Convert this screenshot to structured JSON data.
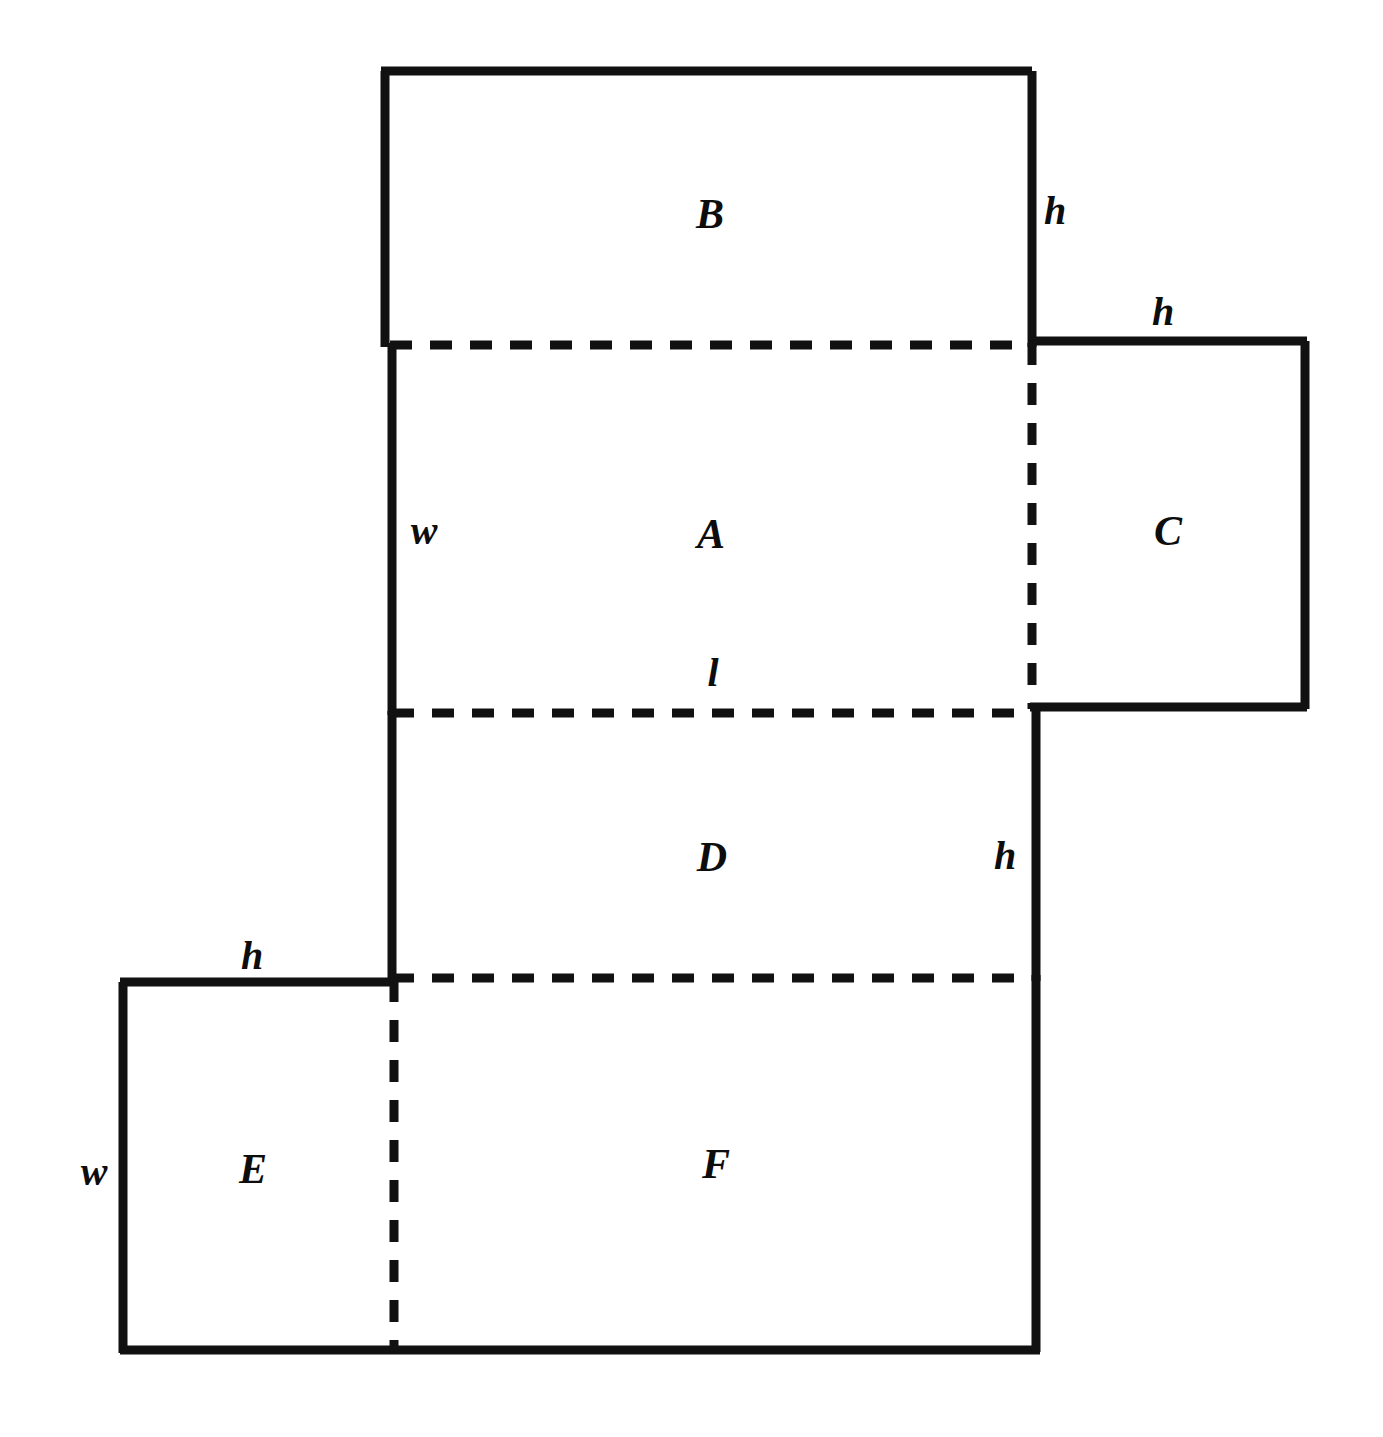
{
  "figure": {
    "type": "box-net-diagram",
    "stroke_color": "#111111",
    "background_color": "#ffffff",
    "solid_stroke_width": 9,
    "dashed_stroke_width": 9,
    "dash_pattern": "22 18"
  },
  "faces": [
    {
      "id": "B",
      "label": "B",
      "cx": 710,
      "cy": 214
    },
    {
      "id": "A",
      "label": "A",
      "cx": 711,
      "cy": 534
    },
    {
      "id": "C",
      "label": "C",
      "cx": 1168,
      "cy": 531
    },
    {
      "id": "D",
      "label": "D",
      "cx": 712,
      "cy": 857
    },
    {
      "id": "E",
      "label": "E",
      "cx": 253,
      "cy": 1169
    },
    {
      "id": "F",
      "label": "F",
      "cx": 716,
      "cy": 1164
    }
  ],
  "dimensions": [
    {
      "id": "h-b-right",
      "label": "h",
      "cx": 1055,
      "cy": 211
    },
    {
      "id": "h-c-top",
      "label": "h",
      "cx": 1163,
      "cy": 312
    },
    {
      "id": "w-a-left",
      "label": "w",
      "cx": 424,
      "cy": 531
    },
    {
      "id": "l-a-bottom",
      "label": "l",
      "cx": 713,
      "cy": 673
    },
    {
      "id": "h-d-right",
      "label": "h",
      "cx": 1005,
      "cy": 856
    },
    {
      "id": "h-e-top",
      "label": "h",
      "cx": 252,
      "cy": 956
    },
    {
      "id": "w-e-left",
      "label": "w",
      "cx": 94,
      "cy": 1172
    }
  ],
  "geometry": {
    "solid_segments": [
      {
        "name": "b-top",
        "x1": 381,
        "y1": 71,
        "x2": 1032,
        "y2": 71
      },
      {
        "name": "b-left",
        "x1": 385,
        "y1": 71,
        "x2": 385,
        "y2": 347
      },
      {
        "name": "b-right",
        "x1": 1032,
        "y1": 71,
        "x2": 1032,
        "y2": 347
      },
      {
        "name": "a-left",
        "x1": 392,
        "y1": 343,
        "x2": 392,
        "y2": 715
      },
      {
        "name": "c-top",
        "x1": 1030,
        "y1": 341,
        "x2": 1307,
        "y2": 341
      },
      {
        "name": "c-right",
        "x1": 1305,
        "y1": 341,
        "x2": 1305,
        "y2": 709
      },
      {
        "name": "c-bottom",
        "x1": 1030,
        "y1": 707,
        "x2": 1307,
        "y2": 707
      },
      {
        "name": "d-left",
        "x1": 392,
        "y1": 711,
        "x2": 392,
        "y2": 981
      },
      {
        "name": "d-right",
        "x1": 1036,
        "y1": 707,
        "x2": 1036,
        "y2": 981
      },
      {
        "name": "e-top",
        "x1": 120,
        "y1": 982,
        "x2": 395,
        "y2": 982
      },
      {
        "name": "e-left",
        "x1": 123,
        "y1": 982,
        "x2": 123,
        "y2": 1353
      },
      {
        "name": "ef-bottom",
        "x1": 120,
        "y1": 1350,
        "x2": 1040,
        "y2": 1350
      },
      {
        "name": "f-right",
        "x1": 1036,
        "y1": 975,
        "x2": 1036,
        "y2": 1352
      }
    ],
    "dashed_segments": [
      {
        "name": "b-a-fold",
        "x1": 390,
        "y1": 345,
        "x2": 1034,
        "y2": 345
      },
      {
        "name": "a-c-fold",
        "x1": 1032,
        "y1": 343,
        "x2": 1032,
        "y2": 709
      },
      {
        "name": "a-d-fold",
        "x1": 392,
        "y1": 713,
        "x2": 1036,
        "y2": 713
      },
      {
        "name": "d-f-fold",
        "x1": 392,
        "y1": 978,
        "x2": 1038,
        "y2": 978
      },
      {
        "name": "e-f-fold",
        "x1": 394,
        "y1": 980,
        "x2": 394,
        "y2": 1350
      }
    ]
  }
}
